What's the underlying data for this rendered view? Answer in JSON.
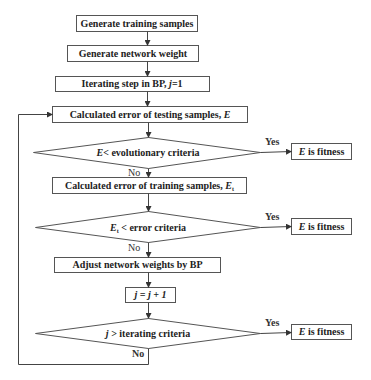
{
  "nodes": {
    "n1": {
      "text": "Generate training samples"
    },
    "n2": {
      "text": "Generate network weight"
    },
    "n3": {
      "prefix": "Iterating step in BP, ",
      "var": "j",
      "suffix": "=1"
    },
    "n4": {
      "prefix": "Calculated error of testing samples, ",
      "var": "E"
    },
    "d1": {
      "var": "E",
      "suffix": "< evolutionary criteria"
    },
    "f1": {
      "var": "E",
      "suffix": " is fitness"
    },
    "n5": {
      "prefix": "Calculated error of training samples, ",
      "var": "E",
      "sub": "t"
    },
    "d2": {
      "var": "E",
      "sub": "t",
      "suffix": " < error criteria"
    },
    "f2": {
      "var": "E",
      "suffix": " is fitness"
    },
    "n6": {
      "text": "Adjust network weights by BP"
    },
    "n7": {
      "text": "j = j + 1"
    },
    "d3": {
      "var": "j",
      "suffix": " > iterating criteria"
    },
    "f3": {
      "var": "E",
      "suffix": " is fitness"
    }
  },
  "edges": {
    "d1_yes": "Yes",
    "d1_no": "No",
    "d2_yes": "Yes",
    "d2_no": "No",
    "d3_yes": "Yes",
    "d3_no": "No"
  },
  "colors": {
    "stroke": "#555555",
    "text": "#222222",
    "background": "#ffffff"
  }
}
